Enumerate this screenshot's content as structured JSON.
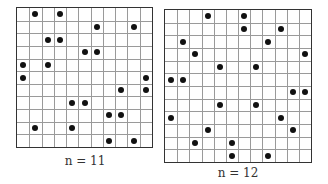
{
  "figures": [
    {
      "id": "g1",
      "n": 11,
      "label": "n = 11",
      "dots": [
        [
          0,
          1
        ],
        [
          0,
          3
        ],
        [
          1,
          6
        ],
        [
          1,
          9
        ],
        [
          2,
          2
        ],
        [
          2,
          3
        ],
        [
          3,
          5
        ],
        [
          3,
          6
        ],
        [
          4,
          0
        ],
        [
          4,
          2
        ],
        [
          5,
          0
        ],
        [
          5,
          10
        ],
        [
          6,
          8
        ],
        [
          6,
          10
        ],
        [
          7,
          4
        ],
        [
          7,
          5
        ],
        [
          8,
          7
        ],
        [
          8,
          8
        ],
        [
          9,
          1
        ],
        [
          9,
          4
        ],
        [
          10,
          7
        ],
        [
          10,
          9
        ]
      ]
    },
    {
      "id": "g2",
      "n": 12,
      "label": "n = 12",
      "dots": [
        [
          0,
          3
        ],
        [
          0,
          6
        ],
        [
          1,
          6
        ],
        [
          1,
          9
        ],
        [
          2,
          1
        ],
        [
          2,
          8
        ],
        [
          3,
          2
        ],
        [
          3,
          11
        ],
        [
          4,
          4
        ],
        [
          4,
          7
        ],
        [
          5,
          0
        ],
        [
          5,
          1
        ],
        [
          6,
          10
        ],
        [
          6,
          11
        ],
        [
          7,
          4
        ],
        [
          7,
          7
        ],
        [
          8,
          0
        ],
        [
          8,
          9
        ],
        [
          9,
          3
        ],
        [
          9,
          10
        ],
        [
          10,
          2
        ],
        [
          10,
          5
        ],
        [
          11,
          5
        ],
        [
          11,
          8
        ]
      ]
    }
  ],
  "colors": {
    "grid_line": "#9a9a9a",
    "border": "#333333",
    "dot": "#111111"
  }
}
